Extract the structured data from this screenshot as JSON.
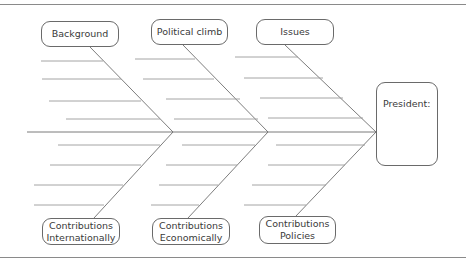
{
  "diagram": {
    "type": "fishbone",
    "colors": {
      "line": "#7a7a7a",
      "rib": "#9a9a9a",
      "border": "#6a6a6a",
      "text": "#3a3a3a"
    },
    "head": {
      "label": "President:",
      "blank_lines": 3
    },
    "top_categories": [
      {
        "label": "Background"
      },
      {
        "label": "Political climb"
      },
      {
        "label": "Issues"
      }
    ],
    "bottom_categories": [
      {
        "line1": "Contributions",
        "line2": "Internationally"
      },
      {
        "line1": "Contributions",
        "line2": "Economically"
      },
      {
        "line1": "Contributions",
        "line2": "Policies"
      }
    ],
    "ribs_per_branch": 4
  }
}
